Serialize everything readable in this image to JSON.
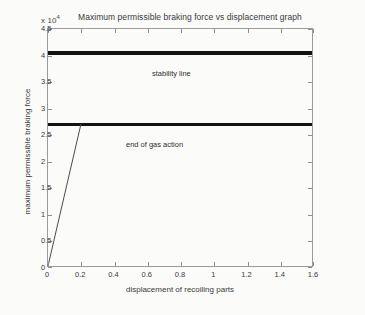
{
  "chart_data": {
    "type": "line",
    "title": "Maximum permissible braking force vs displacement graph",
    "xlabel": "displacement of recoiling parts",
    "ylabel": "maximum permissible braking force",
    "y_multiplier_label": "x 10",
    "y_multiplier_exponent": "4",
    "xlim": [
      0,
      1.6
    ],
    "ylim": [
      0,
      4.5
    ],
    "grid": false,
    "legend": "none",
    "xticks": [
      "0",
      "0.2",
      "0.4",
      "0.6",
      "0.8",
      "1",
      "1.2",
      "1.4",
      "1.6"
    ],
    "xtick_values": [
      0,
      0.2,
      0.4,
      0.6,
      0.8,
      1,
      1.2,
      1.4,
      1.6
    ],
    "yticks": [
      "0",
      "0.5",
      "1",
      "1.5",
      "2",
      "2.5",
      "3",
      "3.5",
      "4",
      "4.5"
    ],
    "ytick_values": [
      0,
      0.5,
      1,
      1.5,
      2,
      2.5,
      3,
      3.5,
      4,
      4.5
    ],
    "series": [
      {
        "name": "stability line",
        "style": "thick-horizontal",
        "y_value": 4.05,
        "x": [
          0,
          1.6
        ],
        "values": [
          4.05,
          4.05
        ]
      },
      {
        "name": "end of gas action",
        "style": "thick-horizontal",
        "y_value": 2.7,
        "x": [
          0,
          1.6
        ],
        "values": [
          2.7,
          2.7
        ]
      },
      {
        "name": "gas action ramp",
        "style": "thin-line",
        "x": [
          0,
          0.2
        ],
        "values": [
          0,
          2.7
        ]
      }
    ],
    "annotations": [
      {
        "text": "stability line",
        "x": 0.35,
        "y": 4.3
      },
      {
        "text": "end of gas action",
        "x": 0.19,
        "y": 2.95
      }
    ],
    "colors": {
      "line": "#131313",
      "axis": "#9a9a9a",
      "text": "#3a3a3a",
      "background": "#fbfbfa"
    }
  }
}
